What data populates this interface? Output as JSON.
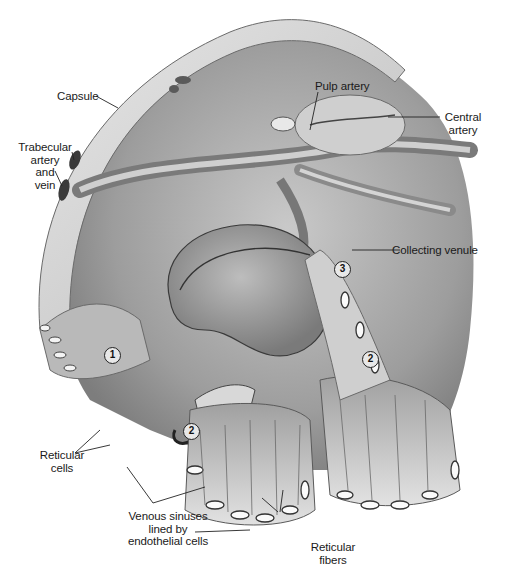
{
  "figure": {
    "style": "grayscale pencil anatomical illustration",
    "colors": {
      "background": "#ffffff",
      "ink": "#1a1a1a",
      "tissue_light": "#d9d9d9",
      "tissue_mid": "#a8a8a8",
      "tissue_dark": "#555555"
    }
  },
  "labels": {
    "capsule": "Capsule",
    "trabecular_1": "Trabecular",
    "trabecular_2": "artery",
    "trabecular_3": "and",
    "trabecular_4": "vein",
    "pulp_artery": "Pulp artery",
    "central_artery_1": "Central",
    "central_artery_2": "artery",
    "collecting_venule": "Collecting venule",
    "reticular_cells_1": "Reticular",
    "reticular_cells_2": "cells",
    "venous_sinuses_1": "Venous sinuses",
    "venous_sinuses_2": "lined by",
    "venous_sinuses_3": "endothelial cells",
    "reticular_fibers_1": "Reticular",
    "reticular_fibers_2": "fibers",
    "sheathed_artery": "Sheathed artery"
  },
  "markers": [
    {
      "number": "1",
      "x": 104,
      "y": 347
    },
    {
      "number": "2",
      "x": 362,
      "y": 351
    },
    {
      "number": "2",
      "x": 183,
      "y": 423
    },
    {
      "number": "3",
      "x": 334,
      "y": 261
    }
  ]
}
